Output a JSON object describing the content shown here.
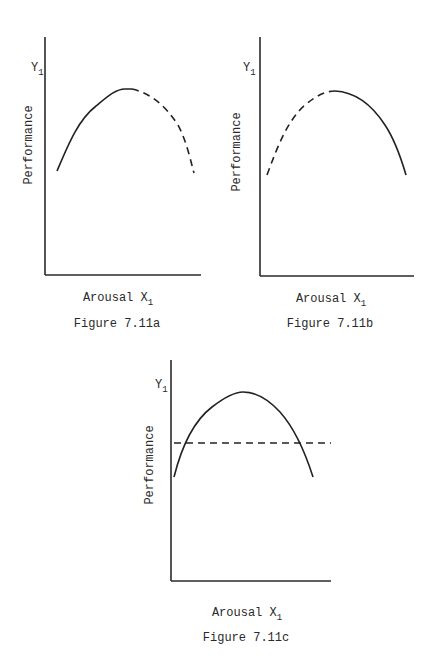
{
  "figures": [
    {
      "id": "a",
      "caption": "Figure 7.11a",
      "y_label": "Performance",
      "y_marker": "Y",
      "y_marker_sub": "1",
      "x_label": "Arousal X",
      "x_label_sub": "1",
      "segments": [
        {
          "style": "solid",
          "description": "rising inverted-U left half up to peak"
        },
        {
          "style": "dashed",
          "description": "falling inverted-U right half after peak"
        }
      ]
    },
    {
      "id": "b",
      "caption": "Figure 7.11b",
      "y_label": "Performance",
      "y_marker": "Y",
      "y_marker_sub": "1",
      "x_label": "Arousal X",
      "x_label_sub": "1",
      "segments": [
        {
          "style": "dashed",
          "description": "rising inverted-U left half up to peak"
        },
        {
          "style": "solid",
          "description": "falling inverted-U right half after peak"
        }
      ]
    },
    {
      "id": "c",
      "caption": "Figure 7.11c",
      "y_label": "Performance",
      "y_marker": "Y",
      "y_marker_sub": "1",
      "x_label": "Arousal X",
      "x_label_sub": "1",
      "segments": [
        {
          "style": "solid",
          "description": "full inverted-U curve"
        },
        {
          "style": "dashed",
          "description": "horizontal line crossing the curve on both sides"
        }
      ]
    }
  ]
}
